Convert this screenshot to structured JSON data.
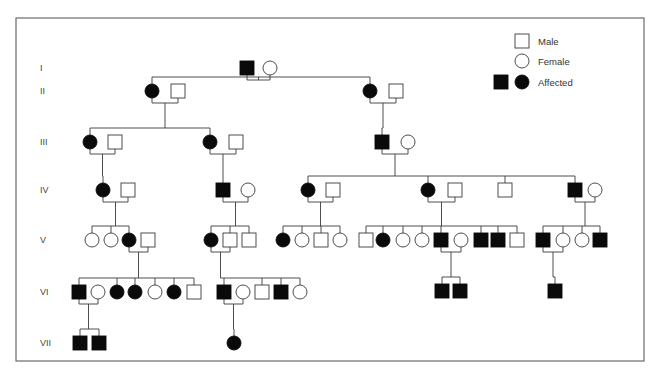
{
  "figure": {
    "type": "pedigree-chart",
    "width": 659,
    "height": 374,
    "frame": {
      "x": 16,
      "y": 18,
      "w": 628,
      "h": 343
    },
    "colors": {
      "affected": "#0a0a0a",
      "unaffected_fill": "#ffffff",
      "line": "#3a3a3a",
      "frame": "#6a6a6a"
    }
  },
  "legend": {
    "items": [
      {
        "label": "Male",
        "symbols": [
          {
            "sex": "M",
            "affected": false
          }
        ]
      },
      {
        "label": "Female",
        "symbols": [
          {
            "sex": "F",
            "affected": false
          }
        ]
      },
      {
        "label": "Affected",
        "symbols": [
          {
            "sex": "M",
            "affected": true
          },
          {
            "sex": "F",
            "affected": true
          }
        ]
      }
    ]
  },
  "generations": [
    {
      "label": "I",
      "y": 68
    },
    {
      "label": "II",
      "y": 91
    },
    {
      "label": "III",
      "y": 142
    },
    {
      "label": "IV",
      "y": 190
    },
    {
      "label": "V",
      "y": 240
    },
    {
      "label": "VI",
      "y": 292
    },
    {
      "label": "VII",
      "y": 343
    }
  ],
  "individuals": [
    {
      "id": "I-1",
      "gen": "I",
      "sex": "M",
      "affected": true,
      "x": 247,
      "y": 68
    },
    {
      "id": "I-2",
      "gen": "I",
      "sex": "F",
      "affected": false,
      "x": 270,
      "y": 68
    },
    {
      "id": "II-1",
      "gen": "II",
      "sex": "F",
      "affected": true,
      "x": 152,
      "y": 91
    },
    {
      "id": "II-2",
      "gen": "II",
      "sex": "M",
      "affected": false,
      "x": 178,
      "y": 91
    },
    {
      "id": "II-3",
      "gen": "II",
      "sex": "F",
      "affected": true,
      "x": 370,
      "y": 91
    },
    {
      "id": "II-4",
      "gen": "II",
      "sex": "M",
      "affected": false,
      "x": 396,
      "y": 91
    },
    {
      "id": "III-1",
      "gen": "III",
      "sex": "F",
      "affected": true,
      "x": 90,
      "y": 142
    },
    {
      "id": "III-2",
      "gen": "III",
      "sex": "M",
      "affected": false,
      "x": 115,
      "y": 142
    },
    {
      "id": "III-3",
      "gen": "III",
      "sex": "F",
      "affected": true,
      "x": 210,
      "y": 142
    },
    {
      "id": "III-4",
      "gen": "III",
      "sex": "M",
      "affected": false,
      "x": 236,
      "y": 142
    },
    {
      "id": "III-5",
      "gen": "III",
      "sex": "M",
      "affected": true,
      "x": 382,
      "y": 142
    },
    {
      "id": "III-6",
      "gen": "III",
      "sex": "F",
      "affected": false,
      "x": 408,
      "y": 142
    },
    {
      "id": "IV-1",
      "gen": "IV",
      "sex": "F",
      "affected": true,
      "x": 103,
      "y": 190
    },
    {
      "id": "IV-2",
      "gen": "IV",
      "sex": "M",
      "affected": false,
      "x": 128,
      "y": 190
    },
    {
      "id": "IV-3",
      "gen": "IV",
      "sex": "M",
      "affected": true,
      "x": 223,
      "y": 190
    },
    {
      "id": "IV-4",
      "gen": "IV",
      "sex": "F",
      "affected": false,
      "x": 248,
      "y": 190
    },
    {
      "id": "IV-5",
      "gen": "IV",
      "sex": "F",
      "affected": true,
      "x": 308,
      "y": 190
    },
    {
      "id": "IV-6",
      "gen": "IV",
      "sex": "M",
      "affected": false,
      "x": 333,
      "y": 190
    },
    {
      "id": "IV-7",
      "gen": "IV",
      "sex": "F",
      "affected": true,
      "x": 428,
      "y": 190
    },
    {
      "id": "IV-8",
      "gen": "IV",
      "sex": "M",
      "affected": false,
      "x": 455,
      "y": 190
    },
    {
      "id": "IV-9",
      "gen": "IV",
      "sex": "M",
      "affected": false,
      "x": 505,
      "y": 190
    },
    {
      "id": "IV-10",
      "gen": "IV",
      "sex": "M",
      "affected": true,
      "x": 575,
      "y": 190
    },
    {
      "id": "IV-11",
      "gen": "IV",
      "sex": "F",
      "affected": false,
      "x": 595,
      "y": 190
    },
    {
      "id": "V-1",
      "gen": "V",
      "sex": "F",
      "affected": false,
      "x": 92,
      "y": 240
    },
    {
      "id": "V-2",
      "gen": "V",
      "sex": "F",
      "affected": false,
      "x": 111,
      "y": 240
    },
    {
      "id": "V-3",
      "gen": "V",
      "sex": "F",
      "affected": true,
      "x": 129,
      "y": 240
    },
    {
      "id": "V-4",
      "gen": "V",
      "sex": "M",
      "affected": false,
      "x": 148,
      "y": 240
    },
    {
      "id": "V-5",
      "gen": "V",
      "sex": "F",
      "affected": true,
      "x": 211,
      "y": 240
    },
    {
      "id": "V-6",
      "gen": "V",
      "sex": "M",
      "affected": false,
      "x": 230,
      "y": 240
    },
    {
      "id": "V-7",
      "gen": "V",
      "sex": "M",
      "affected": false,
      "x": 249,
      "y": 240
    },
    {
      "id": "V-8",
      "gen": "V",
      "sex": "F",
      "affected": true,
      "x": 283,
      "y": 240
    },
    {
      "id": "V-9",
      "gen": "V",
      "sex": "F",
      "affected": false,
      "x": 302,
      "y": 240
    },
    {
      "id": "V-10",
      "gen": "V",
      "sex": "M",
      "affected": false,
      "x": 321,
      "y": 240
    },
    {
      "id": "V-11",
      "gen": "V",
      "sex": "F",
      "affected": false,
      "x": 340,
      "y": 240
    },
    {
      "id": "V-12",
      "gen": "V",
      "sex": "M",
      "affected": false,
      "x": 366,
      "y": 240
    },
    {
      "id": "V-13",
      "gen": "V",
      "sex": "F",
      "affected": true,
      "x": 383,
      "y": 240
    },
    {
      "id": "V-14",
      "gen": "V",
      "sex": "F",
      "affected": false,
      "x": 403,
      "y": 240
    },
    {
      "id": "V-15",
      "gen": "V",
      "sex": "F",
      "affected": false,
      "x": 422,
      "y": 240
    },
    {
      "id": "V-16",
      "gen": "V",
      "sex": "M",
      "affected": true,
      "x": 441,
      "y": 240
    },
    {
      "id": "V-17",
      "gen": "V",
      "sex": "F",
      "affected": false,
      "x": 461,
      "y": 240
    },
    {
      "id": "V-18",
      "gen": "V",
      "sex": "M",
      "affected": true,
      "x": 481,
      "y": 240
    },
    {
      "id": "V-19",
      "gen": "V",
      "sex": "M",
      "affected": true,
      "x": 498,
      "y": 240
    },
    {
      "id": "V-20",
      "gen": "V",
      "sex": "M",
      "affected": false,
      "x": 517,
      "y": 240
    },
    {
      "id": "V-21",
      "gen": "V",
      "sex": "M",
      "affected": true,
      "x": 543,
      "y": 240
    },
    {
      "id": "V-22",
      "gen": "V",
      "sex": "F",
      "affected": false,
      "x": 563,
      "y": 240
    },
    {
      "id": "V-23",
      "gen": "V",
      "sex": "F",
      "affected": false,
      "x": 582,
      "y": 240
    },
    {
      "id": "V-24",
      "gen": "V",
      "sex": "M",
      "affected": true,
      "x": 600,
      "y": 240
    },
    {
      "id": "VI-1",
      "gen": "VI",
      "sex": "M",
      "affected": true,
      "x": 79,
      "y": 292
    },
    {
      "id": "VI-2",
      "gen": "VI",
      "sex": "F",
      "affected": false,
      "x": 98,
      "y": 292
    },
    {
      "id": "VI-3",
      "gen": "VI",
      "sex": "F",
      "affected": true,
      "x": 117,
      "y": 292
    },
    {
      "id": "VI-4",
      "gen": "VI",
      "sex": "F",
      "affected": true,
      "x": 135,
      "y": 292
    },
    {
      "id": "VI-5",
      "gen": "VI",
      "sex": "F",
      "affected": false,
      "x": 155,
      "y": 292
    },
    {
      "id": "VI-6",
      "gen": "VI",
      "sex": "F",
      "affected": true,
      "x": 174,
      "y": 292
    },
    {
      "id": "VI-7",
      "gen": "VI",
      "sex": "M",
      "affected": false,
      "x": 194,
      "y": 292
    },
    {
      "id": "VI-8",
      "gen": "VI",
      "sex": "M",
      "affected": true,
      "x": 224,
      "y": 292
    },
    {
      "id": "VI-9",
      "gen": "VI",
      "sex": "F",
      "affected": false,
      "x": 243,
      "y": 292
    },
    {
      "id": "VI-10",
      "gen": "VI",
      "sex": "M",
      "affected": false,
      "x": 262,
      "y": 292
    },
    {
      "id": "VI-11",
      "gen": "VI",
      "sex": "M",
      "affected": true,
      "x": 281,
      "y": 292
    },
    {
      "id": "VI-12",
      "gen": "VI",
      "sex": "F",
      "affected": false,
      "x": 300,
      "y": 292
    },
    {
      "id": "VI-13",
      "gen": "VI",
      "sex": "M",
      "affected": true,
      "x": 442,
      "y": 291
    },
    {
      "id": "VI-14",
      "gen": "VI",
      "sex": "M",
      "affected": true,
      "x": 460,
      "y": 291
    },
    {
      "id": "VI-15",
      "gen": "VI",
      "sex": "M",
      "affected": true,
      "x": 555,
      "y": 291
    },
    {
      "id": "VII-1",
      "gen": "VII",
      "sex": "M",
      "affected": true,
      "x": 80,
      "y": 343
    },
    {
      "id": "VII-2",
      "gen": "VII",
      "sex": "M",
      "affected": true,
      "x": 99,
      "y": 343
    },
    {
      "id": "VII-3",
      "gen": "VII",
      "sex": "F",
      "affected": true,
      "x": 234,
      "y": 343
    }
  ],
  "families": [
    {
      "parents": [
        "I-1",
        "I-2"
      ],
      "children": [
        "II-1",
        "II-3"
      ]
    },
    {
      "parents": [
        "II-1",
        "II-2"
      ],
      "children": [
        "III-1",
        "III-3"
      ]
    },
    {
      "parents": [
        "II-3",
        "II-4"
      ],
      "children": [
        "III-5"
      ]
    },
    {
      "parents": [
        "III-1",
        "III-2"
      ],
      "children": [
        "IV-1"
      ]
    },
    {
      "parents": [
        "III-3",
        "III-4"
      ],
      "children": [
        "IV-3"
      ]
    },
    {
      "parents": [
        "III-5",
        "III-6"
      ],
      "children": [
        "IV-5",
        "IV-7",
        "IV-9",
        "IV-10"
      ]
    },
    {
      "parents": [
        "IV-1",
        "IV-2"
      ],
      "children": [
        "V-1",
        "V-2",
        "V-3"
      ]
    },
    {
      "parents": [
        "IV-3",
        "IV-4"
      ],
      "children": [
        "V-5",
        "V-6",
        "V-7"
      ]
    },
    {
      "parents": [
        "IV-5",
        "IV-6"
      ],
      "children": [
        "V-8",
        "V-9",
        "V-10",
        "V-11"
      ]
    },
    {
      "parents": [
        "IV-7",
        "IV-8"
      ],
      "children": [
        "V-12",
        "V-13",
        "V-14",
        "V-15",
        "V-16",
        "V-18",
        "V-19",
        "V-20"
      ]
    },
    {
      "parents": [
        "IV-10",
        "IV-11"
      ],
      "children": [
        "V-21",
        "V-22",
        "V-23",
        "V-24"
      ]
    },
    {
      "parents": [
        "V-3",
        "V-4"
      ],
      "children": [
        "VI-1",
        "VI-3",
        "VI-4",
        "VI-5",
        "VI-6",
        "VI-7"
      ]
    },
    {
      "parents": [
        "V-5",
        "V-6"
      ],
      "children": [
        "VI-8",
        "VI-10",
        "VI-11",
        "VI-12"
      ]
    },
    {
      "parents": [
        "V-16",
        "V-17"
      ],
      "children": [
        "VI-13",
        "VI-14"
      ]
    },
    {
      "parents": [
        "V-21",
        "V-22"
      ],
      "children": [
        "VI-15"
      ]
    },
    {
      "parents": [
        "VI-1",
        "VI-2"
      ],
      "children": [
        "VII-1",
        "VII-2"
      ]
    },
    {
      "parents": [
        "VI-8",
        "VI-9"
      ],
      "children": [
        "VII-3"
      ]
    }
  ]
}
